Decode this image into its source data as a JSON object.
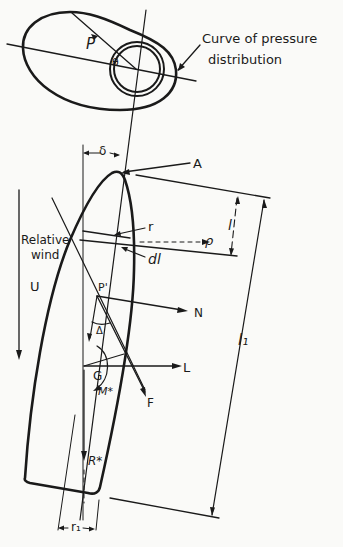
{
  "figure": {
    "labels": {
      "p": "P",
      "theta": "θ",
      "curve_line1": "Curve of pressure",
      "curve_line2": "distribution",
      "delta": "δ",
      "a": "A",
      "l": "l",
      "l1": "l₁",
      "r": "r",
      "rho": "ρ",
      "dl": "dl",
      "relative_wind_line1": "Relative",
      "relative_wind_line2": "wind",
      "u": "U",
      "p_prime": "P'",
      "n": "N",
      "big_delta": "Δ",
      "g": "G",
      "lift": "L",
      "m_star": "M*",
      "f": "F",
      "r_star": "R*",
      "r1": "r₁"
    },
    "colors": {
      "ink": "#1a1a1a",
      "paper": "#fafaf8"
    }
  }
}
